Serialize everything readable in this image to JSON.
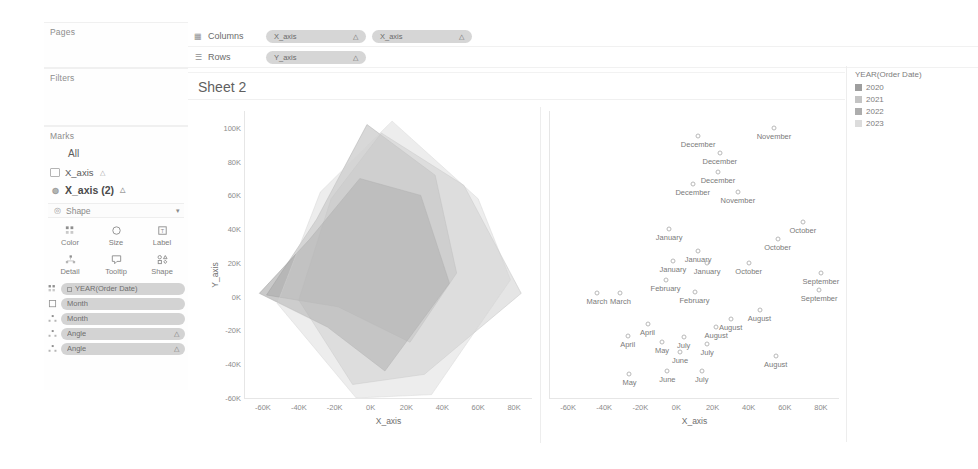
{
  "sidebar": {
    "pages": {
      "title": "Pages"
    },
    "filters": {
      "title": "Filters"
    },
    "marks": {
      "title": "Marks",
      "all_label": "All",
      "layers": [
        {
          "label": "X_axis",
          "icon": "square-mark-icon",
          "suffix": "△",
          "active": false
        },
        {
          "label": "X_axis (2)",
          "icon": "shape-mark-icon",
          "suffix": "△",
          "active": true
        }
      ],
      "shape_selector": {
        "label": "Shape",
        "icon": "shape-icon",
        "caret": "▾"
      },
      "properties": [
        {
          "label": "Color",
          "icon": "color-icon"
        },
        {
          "label": "Size",
          "icon": "size-icon"
        },
        {
          "label": "Label",
          "icon": "label-icon"
        },
        {
          "label": "Detail",
          "icon": "detail-icon"
        },
        {
          "label": "Tooltip",
          "icon": "tooltip-icon"
        },
        {
          "label": "Shape",
          "icon": "shape-icon"
        }
      ],
      "pills": [
        {
          "label": "YEAR(Order Date)",
          "icon": "color-icon",
          "has_swatch": true,
          "end": ""
        },
        {
          "label": "Month",
          "icon": "label-icon",
          "has_swatch": false,
          "end": ""
        },
        {
          "label": "Month",
          "icon": "detail-icon",
          "has_swatch": false,
          "end": ""
        },
        {
          "label": "Angle",
          "icon": "detail-icon",
          "has_swatch": false,
          "end": "△"
        },
        {
          "label": "Angle",
          "icon": "detail-icon",
          "has_swatch": false,
          "end": "△"
        }
      ]
    }
  },
  "shelves": {
    "columns": {
      "label": "Columns",
      "icon": "columns-icon",
      "pills": [
        {
          "label": "X_axis",
          "end": "△"
        },
        {
          "label": "X_axis",
          "end": "△"
        }
      ]
    },
    "rows": {
      "label": "Rows",
      "icon": "rows-icon",
      "pills": [
        {
          "label": "Y_axis",
          "end": "△"
        }
      ]
    }
  },
  "viz": {
    "sheet_title": "Sheet 2"
  },
  "legend": {
    "title": "YEAR(Order Date)",
    "items": [
      {
        "label": "2020",
        "color": "#9e9e9e"
      },
      {
        "label": "2021",
        "color": "#c4c4c4"
      },
      {
        "label": "2022",
        "color": "#adadad"
      },
      {
        "label": "2023",
        "color": "#dcdcdc"
      }
    ]
  },
  "chart_data": [
    {
      "type": "area",
      "name": "radar-polygon-chart",
      "title": "Sheet 2",
      "xlabel": "X_axis",
      "ylabel": "Y_axis",
      "xlim": [
        -70000,
        90000
      ],
      "ylim": [
        -60000,
        110000
      ],
      "xticks": [
        "-60K",
        "-40K",
        "-20K",
        "0K",
        "20K",
        "40K",
        "60K",
        "80K"
      ],
      "xtick_values": [
        -60000,
        -40000,
        -20000,
        0,
        20000,
        40000,
        60000,
        80000
      ],
      "yticks": [
        "100K",
        "80K",
        "60K",
        "40K",
        "20K",
        "0K",
        "-20K",
        "-40K",
        "-60K"
      ],
      "ytick_values": [
        100000,
        80000,
        60000,
        40000,
        20000,
        0,
        -20000,
        -40000,
        -60000
      ],
      "grid": false,
      "legend": "right",
      "series": [
        {
          "name": "2020",
          "color": "#a8a8a8",
          "opacity": 0.45,
          "points": [
            [
              -2000,
              102000
            ],
            [
              36000,
              72000
            ],
            [
              48000,
              14000
            ],
            [
              22000,
              -27000
            ],
            [
              -18000,
              -6000
            ],
            [
              -58000,
              1000
            ],
            [
              -30000,
              46000
            ]
          ]
        },
        {
          "name": "2021",
          "color": "#bdbdbd",
          "opacity": 0.4,
          "points": [
            [
              6000,
              97000
            ],
            [
              52000,
              66000
            ],
            [
              84000,
              2000
            ],
            [
              30000,
              -46000
            ],
            [
              -10000,
              -52000
            ],
            [
              -40000,
              -2000
            ],
            [
              -22000,
              58000
            ]
          ]
        },
        {
          "name": "2022",
          "color": "#969696",
          "opacity": 0.5,
          "points": [
            [
              -6000,
              70000
            ],
            [
              28000,
              60000
            ],
            [
              44000,
              8000
            ],
            [
              8000,
              -44000
            ],
            [
              -24000,
              -18000
            ],
            [
              -62000,
              2000
            ],
            [
              -34000,
              34000
            ]
          ]
        },
        {
          "name": "2023",
          "color": "#d2d2d2",
          "opacity": 0.4,
          "points": [
            [
              12000,
              104000
            ],
            [
              60000,
              58000
            ],
            [
              78000,
              10000
            ],
            [
              34000,
              -58000
            ],
            [
              -8000,
              -60000
            ],
            [
              -52000,
              -4000
            ],
            [
              -28000,
              62000
            ]
          ]
        }
      ]
    },
    {
      "type": "scatter",
      "name": "month-scatter-chart",
      "xlabel": "X_axis",
      "ylabel": "",
      "xlim": [
        -70000,
        90000
      ],
      "ylim": [
        -60000,
        110000
      ],
      "xticks": [
        "-60K",
        "-40K",
        "-20K",
        "0K",
        "20K",
        "40K",
        "60K",
        "80K"
      ],
      "xtick_values": [
        -60000,
        -40000,
        -20000,
        0,
        20000,
        40000,
        60000,
        80000
      ],
      "grid": false,
      "points": [
        {
          "label": "November",
          "x": 54000,
          "y": 100000
        },
        {
          "label": "December",
          "x": 12000,
          "y": 95000
        },
        {
          "label": "December",
          "x": 24000,
          "y": 85000
        },
        {
          "label": "December",
          "x": 23000,
          "y": 74000
        },
        {
          "label": "December",
          "x": 9000,
          "y": 67000
        },
        {
          "label": "November",
          "x": 34000,
          "y": 62000
        },
        {
          "label": "October",
          "x": 70000,
          "y": 44000
        },
        {
          "label": "January",
          "x": -4000,
          "y": 40000
        },
        {
          "label": "October",
          "x": 56000,
          "y": 34000
        },
        {
          "label": "January",
          "x": 12000,
          "y": 27000
        },
        {
          "label": "January",
          "x": -2000,
          "y": 21000
        },
        {
          "label": "January",
          "x": 17000,
          "y": 20000
        },
        {
          "label": "October",
          "x": 40000,
          "y": 20000
        },
        {
          "label": "September",
          "x": 80000,
          "y": 14000
        },
        {
          "label": "February",
          "x": -6000,
          "y": 10000
        },
        {
          "label": "September",
          "x": 79000,
          "y": 4000
        },
        {
          "label": "February",
          "x": 10000,
          "y": 3000
        },
        {
          "label": "March",
          "x": -44000,
          "y": 2000
        },
        {
          "label": "March",
          "x": -31000,
          "y": 2000
        },
        {
          "label": "August",
          "x": 46000,
          "y": -8000
        },
        {
          "label": "August",
          "x": 30000,
          "y": -13000
        },
        {
          "label": "April",
          "x": -16000,
          "y": -16000
        },
        {
          "label": "August",
          "x": 22000,
          "y": -18000
        },
        {
          "label": "April",
          "x": -27000,
          "y": -23000
        },
        {
          "label": "May",
          "x": -8000,
          "y": -27000
        },
        {
          "label": "July",
          "x": 4000,
          "y": -24000
        },
        {
          "label": "July",
          "x": 17000,
          "y": -28000
        },
        {
          "label": "June",
          "x": 2000,
          "y": -33000
        },
        {
          "label": "August",
          "x": 55000,
          "y": -35000
        },
        {
          "label": "May",
          "x": -26000,
          "y": -46000
        },
        {
          "label": "June",
          "x": -5000,
          "y": -44000
        },
        {
          "label": "July",
          "x": 14000,
          "y": -44000
        }
      ]
    }
  ]
}
